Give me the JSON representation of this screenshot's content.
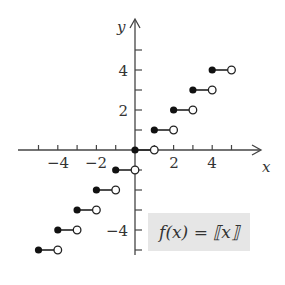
{
  "chart_data": {
    "type": "scatter",
    "title": "",
    "function_label": "f(x) = ⟦x⟧",
    "xlabel": "x",
    "ylabel": "y",
    "xlim": [
      -6,
      6.5
    ],
    "ylim": [
      -6,
      6
    ],
    "x_tick_labels": [
      "−4",
      "−2",
      "2",
      "4"
    ],
    "y_tick_labels": [
      "4",
      "2",
      "−4"
    ],
    "grid": false,
    "segments": [
      {
        "x_start": -5,
        "x_end": -4,
        "y": -5,
        "closed_left": true,
        "open_right": true
      },
      {
        "x_start": -4,
        "x_end": -3,
        "y": -4,
        "closed_left": true,
        "open_right": true
      },
      {
        "x_start": -3,
        "x_end": -2,
        "y": -3,
        "closed_left": true,
        "open_right": true
      },
      {
        "x_start": -2,
        "x_end": -1,
        "y": -2,
        "closed_left": true,
        "open_right": true
      },
      {
        "x_start": -1,
        "x_end": 0,
        "y": -1,
        "closed_left": true,
        "open_right": true
      },
      {
        "x_start": 0,
        "x_end": 1,
        "y": 0,
        "closed_left": true,
        "open_right": true
      },
      {
        "x_start": 1,
        "x_end": 2,
        "y": 1,
        "closed_left": true,
        "open_right": true
      },
      {
        "x_start": 2,
        "x_end": 3,
        "y": 2,
        "closed_left": true,
        "open_right": true
      },
      {
        "x_start": 3,
        "x_end": 4,
        "y": 3,
        "closed_left": true,
        "open_right": true
      },
      {
        "x_start": 4,
        "x_end": 5,
        "y": 4,
        "closed_left": true,
        "open_right": true
      }
    ]
  },
  "labels": {
    "x_axis": "x",
    "y_axis": "y",
    "function": "f(x) = ⟦x⟧",
    "xt_m4": "−4",
    "xt_m2": "−2",
    "xt_2": "2",
    "xt_4": "4",
    "yt_4": "4",
    "yt_2": "2",
    "yt_m4": "−4"
  }
}
